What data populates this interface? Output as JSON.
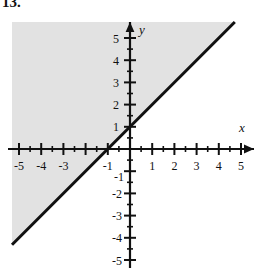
{
  "problem": {
    "number": "13."
  },
  "chart_data": {
    "type": "line",
    "title": "",
    "subtitle": "",
    "xlabel": "x",
    "ylabel": "y",
    "xlim": [
      -5.5,
      5.5
    ],
    "ylim": [
      -5.5,
      5.5
    ],
    "grid": false,
    "legend": null,
    "x_tick_labels": [
      "-5",
      "-4",
      "-3",
      "-1",
      "1",
      "2",
      "3",
      "4",
      "5"
    ],
    "x_tick_values": [
      -5,
      -4,
      -3,
      -1,
      1,
      2,
      3,
      4,
      5
    ],
    "y_tick_labels": [
      "5",
      "4",
      "3",
      "2",
      "1",
      "-1",
      "-2",
      "-3",
      "-4",
      "-5"
    ],
    "y_tick_values": [
      5,
      4,
      3,
      2,
      1,
      -1,
      -2,
      -3,
      -4,
      -5
    ],
    "major_tick_step": 1,
    "minor_tick_step": 0.5,
    "series": [
      {
        "name": "boundary-line",
        "equation": "y = x + 1",
        "slope": 1,
        "intercept": 1,
        "style": "solid",
        "color": "#111111",
        "width": 3,
        "x": [
          -5.3,
          4.5
        ],
        "y": [
          -4.3,
          5.5
        ],
        "points": [
          {
            "x": -1,
            "y": 0
          },
          {
            "x": 0,
            "y": 1
          }
        ]
      }
    ],
    "shaded_region": {
      "name": "solution-region",
      "description": "Region above and to the left of the line y = x + 1",
      "inequality": "y >= x + 1",
      "color": "#e2e2e2",
      "boundary_included": true
    },
    "annotations": []
  },
  "colors": {
    "axis": "#111111",
    "line": "#111111",
    "shading": "#e2e2e2",
    "background": "#ffffff",
    "text": "#111111"
  }
}
